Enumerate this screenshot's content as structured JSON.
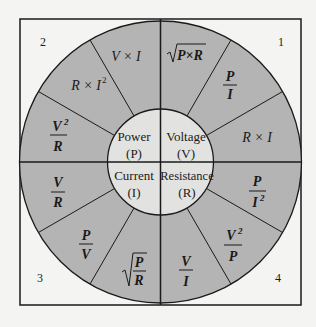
{
  "diagram": {
    "colors": {
      "outer_ring": "#b4b4b4",
      "inner_circle": "#e2e2e0",
      "background": "#f4f4f2",
      "lines": "#1a1a1a"
    },
    "quadrants": [
      {
        "number": "1",
        "center": {
          "label": "Voltage",
          "symbol": "(V)"
        },
        "formulas": [
          "√(P×R)",
          "P/I",
          "R × I"
        ]
      },
      {
        "number": "2",
        "center": {
          "label": "Power",
          "symbol": "(P)"
        },
        "formulas": [
          "V × I",
          "R × I²",
          "V²/R"
        ]
      },
      {
        "number": "3",
        "center": {
          "label": "Current",
          "symbol": "(I)"
        },
        "formulas": [
          "V/R",
          "P/V",
          "√(P/R)"
        ]
      },
      {
        "number": "4",
        "center": {
          "label": "Resistance",
          "symbol": "(R)"
        },
        "formulas": [
          "P/I²",
          "V²/P",
          "V/I"
        ]
      }
    ]
  }
}
